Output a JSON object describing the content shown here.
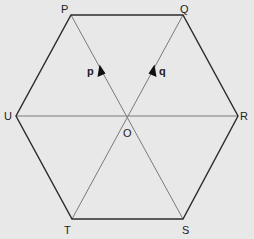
{
  "diagram": {
    "background": "#e8e8e8",
    "edge_color": "#2b2b2b",
    "diagonal_color": "#7a7a7a",
    "vertices": {
      "P": {
        "label": "P",
        "x": 71,
        "y": 15
      },
      "Q": {
        "label": "Q",
        "x": 183,
        "y": 15
      },
      "R": {
        "label": "R",
        "x": 238,
        "y": 116
      },
      "S": {
        "label": "S",
        "x": 183,
        "y": 219
      },
      "T": {
        "label": "T",
        "x": 72,
        "y": 219
      },
      "U": {
        "label": "U",
        "x": 16,
        "y": 116
      },
      "O": {
        "label": "O",
        "x": 127,
        "y": 116
      }
    },
    "edges": [
      [
        "P",
        "Q"
      ],
      [
        "Q",
        "R"
      ],
      [
        "R",
        "S"
      ],
      [
        "S",
        "T"
      ],
      [
        "T",
        "U"
      ],
      [
        "U",
        "P"
      ]
    ],
    "diagonals": [
      [
        "P",
        "S"
      ],
      [
        "Q",
        "T"
      ],
      [
        "U",
        "R"
      ]
    ],
    "vectors": [
      {
        "name": "p",
        "label": "p",
        "from": "O",
        "to": "P"
      },
      {
        "name": "q",
        "label": "q",
        "from": "O",
        "to": "Q"
      }
    ]
  }
}
